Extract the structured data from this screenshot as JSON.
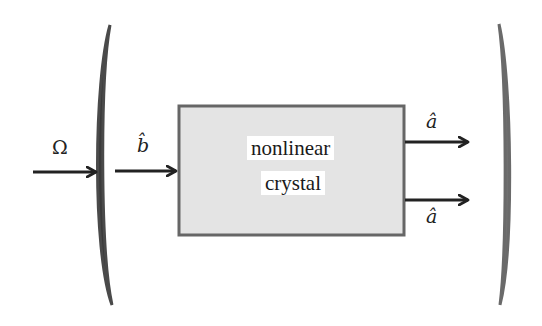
{
  "diagram": {
    "type": "optical-cavity-schematic",
    "input_pump_label": "Ω",
    "intracavity_input_label": "b̂",
    "crystal": {
      "line1": "nonlinear",
      "line2": "crystal"
    },
    "output_labels": [
      "â",
      "â"
    ],
    "colors": {
      "mirror_left": "#3a3a3a",
      "mirror_right": "#707070",
      "crystal_fill": "#e4e4e4",
      "crystal_border": "#666666",
      "arrow": "#222222"
    }
  }
}
